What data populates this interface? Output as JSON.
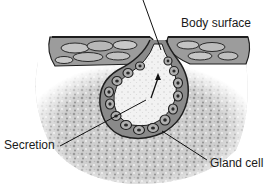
{
  "diagram": {
    "labels": {
      "body_surface": "Body surface",
      "secretion": "Secretion",
      "gland_cell": "Gland cell"
    },
    "colors": {
      "background": "#ffffff",
      "tissue_light": "#d6d6d6",
      "tissue_mid": "#a8a8a8",
      "tissue_dark": "#5a5a5a",
      "outline": "#1e1e1e",
      "lumen": "#efefef",
      "text": "#1a1a1a"
    }
  }
}
